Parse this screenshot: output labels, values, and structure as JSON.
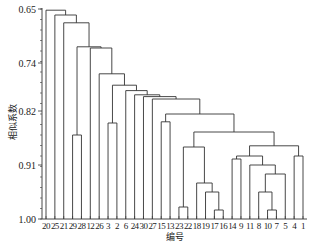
{
  "chart_data": {
    "type": "dendrogram",
    "title": "",
    "xlabel": "编号",
    "ylabel": "相似系数",
    "ylim": [
      0.65,
      1.0
    ],
    "y_inverted": true,
    "yticks": [
      "0.65",
      "0.74",
      "0.82",
      "0.91",
      "1.00"
    ],
    "ytick_values": [
      0.65,
      0.74,
      0.82,
      0.91,
      1.0
    ],
    "leaf_order": [
      "20",
      "25",
      "21",
      "29",
      "28",
      "12",
      "26",
      "3",
      "2",
      "6",
      "24",
      "30",
      "27",
      "15",
      "13",
      "23",
      "22",
      "18",
      "19",
      "17",
      "16",
      "14",
      "9",
      "11",
      "8",
      "10",
      "7",
      "5",
      "4",
      "1"
    ],
    "merges": [
      {
        "a": "10",
        "b": "7",
        "height": 0.986
      },
      {
        "a": "17",
        "b": "16",
        "height": 0.983
      },
      {
        "a": "23",
        "b": "22",
        "height": 0.98
      },
      {
        "a": "19",
        "b": "17-16",
        "height": 0.955
      },
      {
        "a": "8",
        "b": "10-7",
        "height": 0.95
      },
      {
        "a": "18",
        "b": "19-17-16",
        "height": 0.945
      },
      {
        "a": "3",
        "b": "2",
        "height": 0.84
      },
      {
        "a": "29",
        "b": "28",
        "height": 0.86
      },
      {
        "a": "15",
        "b": "13",
        "height": 0.835
      },
      {
        "a": "4",
        "b": "1",
        "height": 0.895
      },
      {
        "a": "8-10-7",
        "b": "5",
        "height": 0.925
      },
      {
        "a": "11",
        "b": "8-10-7-5",
        "height": 0.91
      },
      {
        "a": "14",
        "b": "9",
        "height": 0.9
      },
      {
        "a": "14-9",
        "b": "11-8-10-7-5",
        "height": 0.895
      },
      {
        "a": "14..5",
        "b": "4-1",
        "height": 0.878
      },
      {
        "a": "18-19-17-16",
        "b": "",
        "height": 0.895
      },
      {
        "a": "23-22",
        "b": "18-19-17-16",
        "height": 0.88
      },
      {
        "a": "23..16",
        "b": "14..1",
        "height": 0.85
      },
      {
        "a": "15-13",
        "b": "23..1",
        "height": 0.825
      },
      {
        "a": "27",
        "b": "15..1",
        "height": 0.8
      },
      {
        "a": "30",
        "b": "27..1",
        "height": 0.795
      },
      {
        "a": "24",
        "b": "30..1",
        "height": 0.793
      },
      {
        "a": "6",
        "b": "24..1",
        "height": 0.785
      },
      {
        "a": "3-2",
        "b": "6..1",
        "height": 0.777
      },
      {
        "a": "26",
        "b": "3..1",
        "height": 0.77
      },
      {
        "a": "12",
        "b": "26..1",
        "height": 0.757
      },
      {
        "a": "28",
        "b": "12..1",
        "height": 0.715
      },
      {
        "a": "29",
        "b": "28..1",
        "height": 0.714
      },
      {
        "a": "21",
        "b": "29..1",
        "height": 0.673
      },
      {
        "a": "25",
        "b": "21..1",
        "height": 0.66
      }
    ]
  },
  "axis": {
    "xlabel": "编号",
    "ylabel": "相似系数"
  }
}
